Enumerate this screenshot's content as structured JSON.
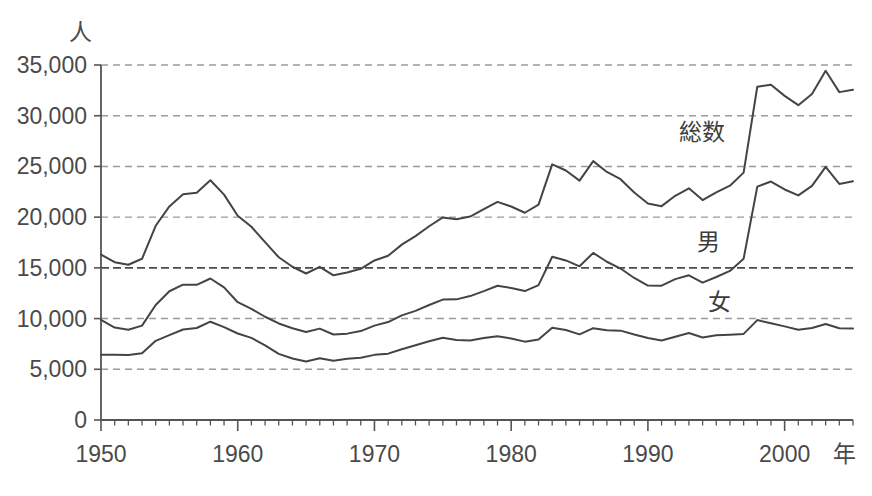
{
  "chart_data": {
    "type": "line",
    "title": "",
    "xlabel": "年",
    "ylabel": "人",
    "xlim": [
      1950,
      2005
    ],
    "ylim": [
      0,
      35000
    ],
    "grid": true,
    "legend_position": "inline-labels",
    "y_ticks": [
      0,
      5000,
      10000,
      15000,
      20000,
      25000,
      30000,
      35000
    ],
    "y_tick_labels": [
      "0",
      "5,000",
      "10,000",
      "15,000",
      "20,000",
      "25,000",
      "30,000",
      "35,000"
    ],
    "x_ticks": [
      1950,
      1960,
      1970,
      1980,
      1990,
      2000
    ],
    "x_tick_labels": [
      "1950",
      "1960",
      "1970",
      "1980",
      "1990",
      "2000"
    ],
    "x_minor_tick_interval": 1,
    "emphasis_gridline": 15000,
    "x": [
      1950,
      1951,
      1952,
      1953,
      1954,
      1955,
      1956,
      1957,
      1958,
      1959,
      1960,
      1961,
      1962,
      1963,
      1964,
      1965,
      1966,
      1967,
      1968,
      1969,
      1970,
      1971,
      1972,
      1973,
      1974,
      1975,
      1976,
      1977,
      1978,
      1979,
      1980,
      1981,
      1982,
      1983,
      1984,
      1985,
      1986,
      1987,
      1988,
      1989,
      1990,
      1991,
      1992,
      1993,
      1994,
      1995,
      1996,
      1997,
      1998,
      1999,
      2000,
      2001,
      2002,
      2003,
      2004,
      2005
    ],
    "series": [
      {
        "name": "総数",
        "label": "総数",
        "values": [
          16311,
          15554,
          15303,
          15894,
          19150,
          21060,
          22265,
          22400,
          23641,
          22223,
          20143,
          19056,
          17542,
          16043,
          15109,
          14444,
          15106,
          14264,
          14542,
          14908,
          15728,
          16199,
          17292,
          18123,
          19105,
          19975,
          19786,
          20055,
          20788,
          21503,
          21048,
          20434,
          21228,
          25202,
          24596,
          23599,
          25524,
          24460,
          23742,
          22436,
          21346,
          21084,
          22104,
          22848,
          21679,
          22445,
          23104,
          24391,
          32863,
          33048,
          31957,
          31042,
          32143,
          34427,
          32325,
          32552
        ]
      },
      {
        "name": "男",
        "label": "男",
        "values": [
          9869,
          9115,
          8891,
          9307,
          11342,
          12692,
          13340,
          13331,
          13949,
          13072,
          11612,
          10960,
          10180,
          9519,
          9051,
          8681,
          9009,
          8432,
          8514,
          8769,
          9306,
          9659,
          10318,
          10759,
          11334,
          11870,
          11895,
          12218,
          12711,
          13239,
          13010,
          12709,
          13298,
          16099,
          15730,
          15154,
          16474,
          15603,
          14932,
          14003,
          13256,
          13245,
          13888,
          14269,
          13543,
          14099,
          14695,
          15901,
          23013,
          23512,
          22727,
          22144,
          23080,
          24963,
          23272,
          23540
        ]
      },
      {
        "name": "女",
        "label": "女",
        "values": [
          6442,
          6439,
          6412,
          6587,
          7808,
          8368,
          8925,
          9069,
          9692,
          9151,
          8531,
          8096,
          7362,
          6524,
          6058,
          5763,
          6097,
          5832,
          6028,
          6139,
          6422,
          6540,
          6974,
          7364,
          7771,
          8105,
          7891,
          7837,
          8077,
          8264,
          8038,
          7725,
          7930,
          9103,
          8866,
          8445,
          9050,
          8857,
          8810,
          8433,
          8090,
          7839,
          8216,
          8579,
          8136,
          8346,
          8409,
          8490,
          9850,
          9536,
          9230,
          8898,
          9063,
          9464,
          9053,
          9012
        ]
      }
    ],
    "series_label_positions": [
      {
        "name": "総数",
        "x_px": 702,
        "y_px": 140
      },
      {
        "name": "男",
        "x_px": 708,
        "y_px": 250
      },
      {
        "name": "女",
        "x_px": 719,
        "y_px": 310
      }
    ],
    "colors": {
      "line": "#444444",
      "grid": "#9a9a9a",
      "grid_emphasis": "#4b4b4b",
      "axis": "#555555",
      "text": "#4a4a4a",
      "background": "#ffffff"
    }
  }
}
